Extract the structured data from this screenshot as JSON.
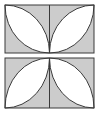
{
  "figure": {
    "canvas": {
      "width": 100,
      "height": 114,
      "background": "#ffffff"
    },
    "colors": {
      "outline": "#3a3a3a",
      "shaded_fill": "#cccccc",
      "petal_fill": "#ffffff",
      "divider": "#3a3a3a",
      "background": "#ffffff"
    },
    "stroke_width": 1,
    "rectangles": [
      {
        "name": "top-rectangle",
        "x": 5,
        "y": 5,
        "width": 89,
        "height": 48,
        "petal_apex": "bottom-center",
        "halves": [
          {
            "name": "top-left-half",
            "x": 5,
            "y": 5,
            "width": 44.5,
            "height": 48,
            "petal_tips": [
              "top-left-corner",
              "bottom-right-corner"
            ],
            "petal_fill": "#ffffff",
            "background_fill": "#cccccc"
          },
          {
            "name": "top-right-half",
            "x": 49.5,
            "y": 5,
            "width": 44.5,
            "height": 48,
            "petal_tips": [
              "top-right-corner",
              "bottom-left-corner"
            ],
            "petal_fill": "#ffffff",
            "background_fill": "#cccccc"
          }
        ]
      },
      {
        "name": "bottom-rectangle",
        "x": 5,
        "y": 58,
        "width": 89,
        "height": 50,
        "petal_apex": "top-center",
        "halves": [
          {
            "name": "bottom-left-half",
            "x": 5,
            "y": 58,
            "width": 44.5,
            "height": 50,
            "petal_tips": [
              "bottom-left-corner",
              "top-right-corner"
            ],
            "petal_fill": "#ffffff",
            "background_fill": "#cccccc"
          },
          {
            "name": "bottom-right-half",
            "x": 49.5,
            "y": 58,
            "width": 44.5,
            "height": 50,
            "petal_tips": [
              "bottom-right-corner",
              "top-left-corner"
            ],
            "petal_fill": "#ffffff",
            "background_fill": "#cccccc"
          }
        ]
      }
    ],
    "counts": {
      "rectangles": 2,
      "halves": 4,
      "petals": 4,
      "arcs": 8
    }
  }
}
